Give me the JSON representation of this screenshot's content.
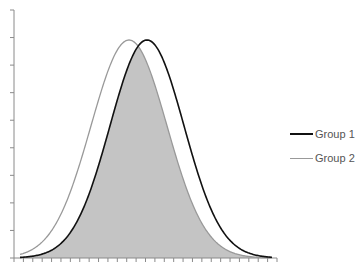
{
  "chart_data": {
    "type": "area",
    "title": "",
    "xlabel": "",
    "ylabel": "",
    "grid": false,
    "legend_position": "right",
    "axes": {
      "x_tick_count": 29,
      "y_tick_count": 10,
      "x_tick_labels": [],
      "y_tick_labels": []
    },
    "series": [
      {
        "name": "Group 1",
        "color": "#111111",
        "mean_px": 147,
        "sd_px": 37,
        "peak_px": 40
      },
      {
        "name": "Group 2",
        "color": "#999999",
        "mean_px": 129,
        "sd_px": 38,
        "peak_px": 40
      }
    ],
    "overlap_fill": "#c4c4c4"
  },
  "legend": {
    "items": [
      {
        "label": "Group 1",
        "color": "#111111"
      },
      {
        "label": "Group 2",
        "color": "#999999"
      }
    ]
  }
}
